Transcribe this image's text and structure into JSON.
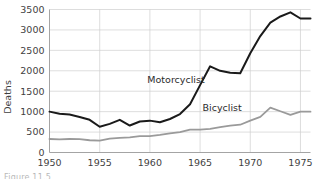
{
  "figure": {
    "caption": "Figure 11.5"
  },
  "chart_data": {
    "type": "line",
    "title": "",
    "xlabel": "",
    "ylabel": "Deaths",
    "xlim": [
      1950,
      1976
    ],
    "ylim": [
      0,
      3500
    ],
    "xticks": [
      1950,
      1955,
      1960,
      1965,
      1970,
      1975
    ],
    "xtick_labels": [
      "1950",
      "1955",
      "1960",
      "1965",
      "1970",
      "1975"
    ],
    "yticks": [
      0,
      500,
      1000,
      1500,
      2000,
      2500,
      3000,
      3500
    ],
    "ytick_labels": [
      "0",
      "500",
      "1000",
      "1500",
      "2000",
      "2500",
      "3000",
      "3500"
    ],
    "grid": true,
    "legend_position": "inline-annotation",
    "x": [
      1950,
      1951,
      1952,
      1953,
      1954,
      1955,
      1956,
      1957,
      1958,
      1959,
      1960,
      1961,
      1962,
      1963,
      1964,
      1965,
      1966,
      1967,
      1968,
      1969,
      1970,
      1971,
      1972,
      1973,
      1974,
      1975,
      1976
    ],
    "series": [
      {
        "name": "Motorcyclist",
        "color": "#1a1a1a",
        "label_x": 1962.6,
        "label_y": 1700,
        "values": [
          1000,
          950,
          930,
          870,
          800,
          630,
          700,
          800,
          660,
          760,
          780,
          740,
          820,
          940,
          1180,
          1650,
          2110,
          2000,
          1950,
          1940,
          2430,
          2850,
          3180,
          3330,
          3430,
          3280,
          3280
        ]
      },
      {
        "name": "Bicyclist",
        "color": "#9a9a9a",
        "label_x": 1967.2,
        "label_y": 1010,
        "values": [
          330,
          320,
          330,
          325,
          300,
          290,
          340,
          360,
          370,
          400,
          400,
          430,
          470,
          500,
          560,
          560,
          580,
          620,
          660,
          680,
          780,
          870,
          1100,
          1010,
          920,
          1000,
          1000
        ]
      }
    ]
  }
}
